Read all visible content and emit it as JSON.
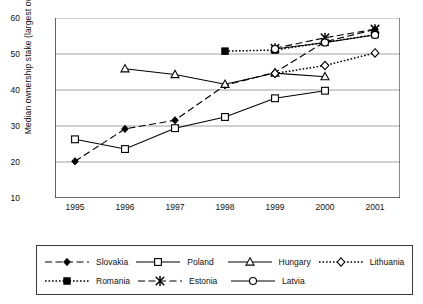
{
  "chart_data": {
    "type": "line",
    "title": "",
    "xlabel": "",
    "ylabel": "Median ownership stake (largest owner)",
    "categories": [
      "1995",
      "1996",
      "1997",
      "1998",
      "1999",
      "2000",
      "2001"
    ],
    "x": [
      1995,
      1996,
      1997,
      1998,
      1999,
      2000,
      2001
    ],
    "xlim": [
      1994.6,
      2001.5
    ],
    "ylim": [
      10,
      60
    ],
    "yticks": [
      10,
      20,
      30,
      40,
      50,
      60
    ],
    "grid": "horizontal",
    "legend_position": "bottom",
    "series": [
      {
        "name": "Slovakia",
        "marker": "filled-diamond",
        "line": "dashed",
        "color": "#000000",
        "values": [
          20.2,
          29.2,
          31.6,
          41.3,
          44.9,
          53.4,
          56.8
        ]
      },
      {
        "name": "Poland",
        "marker": "open-square",
        "line": "solid",
        "color": "#000000",
        "values": [
          26.3,
          23.6,
          29.4,
          32.5,
          37.7,
          39.8,
          null
        ]
      },
      {
        "name": "Hungary",
        "marker": "open-triangle",
        "line": "solid",
        "color": "#000000",
        "values": [
          null,
          45.9,
          44.3,
          41.6,
          44.7,
          43.7,
          null
        ]
      },
      {
        "name": "Lithuania",
        "marker": "open-diamond",
        "line": "dotted",
        "color": "#000000",
        "values": [
          null,
          null,
          null,
          null,
          44.6,
          46.8,
          50.3
        ]
      },
      {
        "name": "Romania",
        "marker": "filled-square",
        "line": "dotted",
        "color": "#000000",
        "values": [
          null,
          null,
          null,
          50.8,
          51.1,
          53.2,
          55.4
        ]
      },
      {
        "name": "Estonia",
        "marker": "star-x",
        "line": "dashed",
        "color": "#000000",
        "values": [
          null,
          null,
          null,
          null,
          51.6,
          54.5,
          56.9
        ]
      },
      {
        "name": "Latvia",
        "marker": "open-circle",
        "line": "solid",
        "color": "#000000",
        "values": [
          null,
          null,
          null,
          null,
          51.4,
          53.2,
          55.3
        ]
      }
    ]
  },
  "axis": {
    "y_label": "Median ownership stake (largest owner)",
    "y_ticks": [
      "60",
      "50",
      "40",
      "30",
      "20",
      "10"
    ],
    "x_ticks": [
      "1995",
      "1996",
      "1997",
      "1998",
      "1999",
      "2000",
      "2001"
    ]
  },
  "legend": {
    "row1": [
      {
        "label": "Slovakia",
        "marker": "filled-diamond",
        "line": "dashed"
      },
      {
        "label": "Poland",
        "marker": "open-square",
        "line": "solid"
      },
      {
        "label": "Hungary",
        "marker": "open-triangle",
        "line": "solid"
      },
      {
        "label": "Lithuania",
        "marker": "open-diamond",
        "line": "dotted"
      }
    ],
    "row2": [
      {
        "label": "Romania",
        "marker": "filled-square",
        "line": "dotted"
      },
      {
        "label": "Estonia",
        "marker": "star-x",
        "line": "dashed"
      },
      {
        "label": "Latvia",
        "marker": "open-circle",
        "line": "solid"
      }
    ]
  },
  "colors": {
    "ink": "#000000",
    "grid": "#8c8c8c",
    "axis": "#3b3b3b",
    "background": "#ffffff"
  }
}
